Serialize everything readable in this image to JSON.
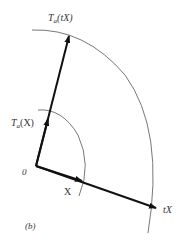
{
  "diagram": {
    "labels": {
      "ta_tx": {
        "T": "T",
        "sub": "a",
        "arg": "(tX)"
      },
      "ta_x": {
        "T": "T",
        "sub": "a",
        "arg": "(X)"
      },
      "origin": "0",
      "x": "X",
      "tx": "tX",
      "panel": "(b)"
    },
    "colors": {
      "arrow": "#111111",
      "arc": "#777777",
      "text": "#333333"
    }
  }
}
